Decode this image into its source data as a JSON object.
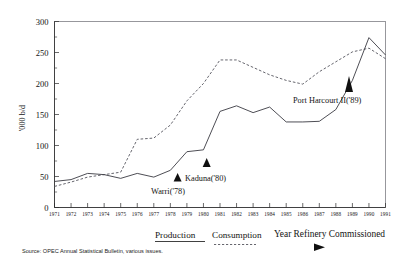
{
  "chart_data": {
    "type": "line",
    "title": "",
    "subtitle": "",
    "xlabel": "",
    "ylabel": "'000 b/d",
    "xlim": [
      1971,
      1991
    ],
    "ylim": [
      0,
      300
    ],
    "ytick_values": [
      0,
      50,
      100,
      150,
      200,
      250,
      300
    ],
    "ytick_labels": [
      "0",
      "50",
      "100",
      "150",
      "200",
      "250",
      "300"
    ],
    "yminor_step": 25,
    "grid": false,
    "legend_position": "below-axes",
    "x": [
      1971,
      1972,
      1973,
      1974,
      1975,
      1976,
      1977,
      1978,
      1979,
      1980,
      1981,
      1982,
      1983,
      1984,
      1985,
      1986,
      1987,
      1988,
      1989,
      1990,
      1991
    ],
    "xtick_labels": [
      "1971",
      "1972",
      "1973",
      "1974",
      "1975",
      "1976",
      "1977",
      "1978",
      "1979",
      "1980",
      "1981",
      "1982",
      "1983",
      "1984",
      "1985",
      "1986",
      "1987",
      "1988",
      "1989",
      "1990",
      "1991"
    ],
    "series": [
      {
        "name": "Production",
        "style": "solid",
        "color": "#3a3a42",
        "values": [
          42,
          45,
          55,
          53,
          47,
          55,
          49,
          60,
          90,
          93,
          155,
          164,
          153,
          162,
          138,
          138,
          139,
          158,
          205,
          274,
          246
        ]
      },
      {
        "name": "Consumption",
        "style": "dashed",
        "color": "#55555d",
        "values": [
          34,
          41,
          49,
          53,
          57,
          110,
          112,
          133,
          172,
          200,
          238,
          238,
          226,
          214,
          205,
          199,
          219,
          235,
          251,
          257,
          240
        ]
      }
    ],
    "annotations": [
      {
        "label": "Warri('78)",
        "x": 1978,
        "marker": "up-triangle",
        "note": "Year refinery commissioned"
      },
      {
        "label": "Kaduna('80)",
        "x": 1980,
        "marker": "up-triangle",
        "note": "Year refinery commissioned"
      },
      {
        "label": "Port Harcourt II('89)",
        "x": 1989,
        "marker": "up-triangle",
        "note": "Year refinery commissioned"
      }
    ]
  },
  "legend": {
    "production_label": "Production",
    "consumption_label": "Consumption",
    "commissioned_label": "Year Refinery Commissioned"
  },
  "annotations": {
    "warri": "Warri('78)",
    "kaduna": "Kaduna('80)",
    "port_harcourt": "Port Harcourt II('89)"
  },
  "axes": {
    "y_title": "'000 b/d",
    "y_ticks": [
      "300",
      "250",
      "200",
      "150",
      "100",
      "50",
      "0"
    ],
    "x_ticks": [
      "1971",
      "1972",
      "1973",
      "1974",
      "1975",
      "1976",
      "1977",
      "1978",
      "1979",
      "1980",
      "1981",
      "1982",
      "1983",
      "1984",
      "1985",
      "1986",
      "1987",
      "1988",
      "1989",
      "1990",
      "1991"
    ]
  },
  "footer": {
    "source": "Source: OPEC Annual Statistical Bulletin, various issues."
  }
}
